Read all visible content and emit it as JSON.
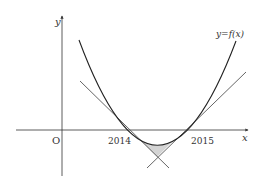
{
  "diagram": {
    "type": "function-graph",
    "labels": {
      "y_axis": "y",
      "x_axis": "x",
      "origin": "O",
      "curve": "y=f(x)",
      "root_left": "2014",
      "root_right": "2015"
    },
    "colors": {
      "curve": "#222222",
      "tangent": "#555555",
      "axis": "#333333",
      "shade": "#d4d4d4"
    },
    "elements": [
      {
        "id": "curve",
        "kind": "parabola",
        "label": "y=f(x)",
        "roots": [
          "2014",
          "2015"
        ]
      },
      {
        "id": "tangent-left",
        "kind": "line",
        "tangent_at": "2014"
      },
      {
        "id": "tangent-right",
        "kind": "line",
        "tangent_at": "2015"
      },
      {
        "id": "shaded-region",
        "kind": "region",
        "bounded_by": [
          "curve",
          "tangent-left",
          "tangent-right"
        ]
      }
    ]
  }
}
